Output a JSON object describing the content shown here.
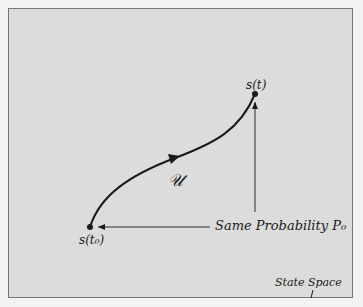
{
  "diagram": {
    "title": "State Space",
    "labels": {
      "end_state": "s(t)",
      "start_state": "s(t₀)",
      "path": "𝒰",
      "annotation": "Same Probability P₀",
      "space": "State Space"
    },
    "colors": {
      "background": "#dcdcdc",
      "border": "#777777",
      "ink": "#1a1a1a"
    },
    "points": {
      "start": {
        "x": 90,
        "y": 227
      },
      "end": {
        "x": 255,
        "y": 94
      }
    }
  }
}
